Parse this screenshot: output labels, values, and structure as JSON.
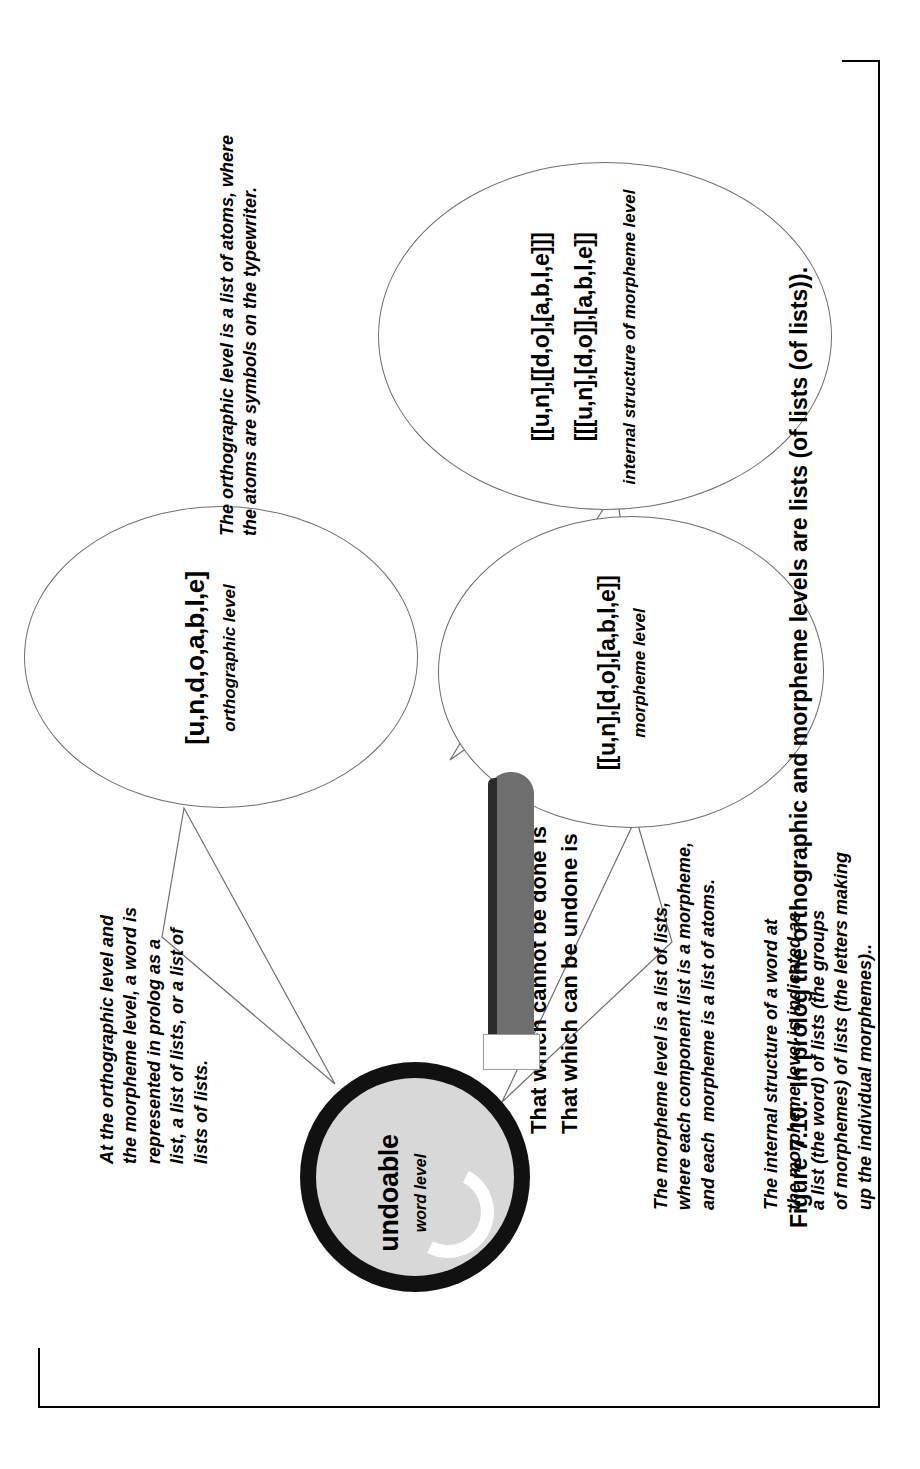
{
  "figure": {
    "caption": "Figure 7.10.  In prolog the orthographic and morpheme levels are lists (of lists (of lists))."
  },
  "magnifier": {
    "word": "undoable",
    "level_label": "word level",
    "lens_color": "#d8d8d8",
    "ring_color": "#111111",
    "handle_color": "#6e6e6e"
  },
  "notes": {
    "top_right": "At the orthographic level and\nthe morpheme level, a word is\nrepresented in prolog as a\nlist, a list of lists, or a list of\nlists of lists.",
    "motto": "That which cannot be done is\nThat which can be undone is",
    "morpheme_desc": "The morpheme level is a list of lists,\nwhere each component list is a morpheme,\nand each  morpheme is a list of atoms.",
    "internal_desc": "The internal structure of a word at\nthe morpheme level is indicated as\na list (the word) of lists (the groups\nof morphemes) of lists (the letters making\nup the individual morphemes)..",
    "orthographic_desc": "The orthographic level is a list of atoms, where\nthe atoms are symbols on the typewriter."
  },
  "bubbles": {
    "orthographic": {
      "code": "[u,n,d,o,a,b,l,e]",
      "label": "orthographic level"
    },
    "morpheme": {
      "code": "[[u,n],[d,o],[a,b,l,e]]",
      "label": "morpheme level"
    },
    "internal": {
      "code_line1": "[[u,n],[[d,o],[a,b,l,e]]]",
      "code_line2": "[[[u,n],[d,o]],[a,b,l,e]]",
      "label": "internal structure of morpheme level"
    }
  }
}
